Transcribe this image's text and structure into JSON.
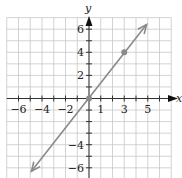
{
  "chart_data": {
    "type": "line",
    "title": "",
    "xlabel": "x",
    "ylabel": "y",
    "xlim": [
      -7,
      7
    ],
    "ylim": [
      -7,
      7
    ],
    "grid": true,
    "x_tick_labels": [
      "-6",
      "-4",
      "-2",
      "1",
      "3",
      "5"
    ],
    "x_tick_values": [
      -6,
      -4,
      -2,
      1,
      3,
      5
    ],
    "y_tick_labels": [
      "6",
      "4",
      "2",
      "-4",
      "-6"
    ],
    "y_tick_values": [
      6,
      4,
      2,
      -4,
      -6
    ],
    "series": [
      {
        "name": "y = 4/3 x",
        "equation": "y = (4/3)x",
        "line_from": [
          -4.9,
          -6.3
        ],
        "line_to": [
          4.9,
          6.4
        ],
        "arrows": "both",
        "color": "#8a8a8a"
      }
    ],
    "points": [
      {
        "x": 0,
        "y": 0
      },
      {
        "x": 3,
        "y": 4
      }
    ]
  },
  "colors": {
    "grid": "#c8c8c8",
    "axis": "#333333",
    "line": "#8a8a8a",
    "point": "#8a8a8a"
  }
}
